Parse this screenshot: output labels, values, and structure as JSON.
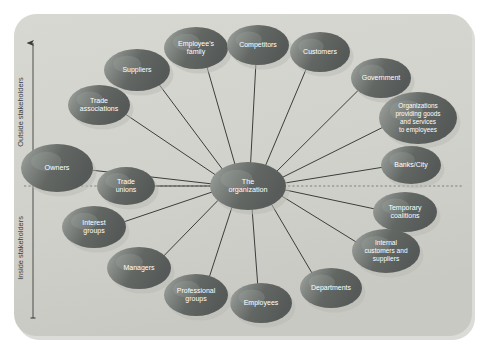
{
  "figure": {
    "panel": {
      "x": 14,
      "y": 14,
      "width": 458,
      "height": 322,
      "radius": 22,
      "fill": "#d3d3ce",
      "edge_shadow": "#bdbdb8"
    },
    "background_color": "#ffffff",
    "caption": ""
  },
  "axis": {
    "name": "stakeholder-axis",
    "x": 33,
    "top_y": 43,
    "bottom_y": 318,
    "color": "#3c3c3c",
    "arrow_end": "top",
    "labels": {
      "outside": "Outside stakeholders",
      "inside": "Inside stakeholders"
    },
    "outside_label_y": 112,
    "inside_label_y": 248
  },
  "divider": {
    "name": "inside-outside-divider",
    "y": 186,
    "x_start": 24,
    "x_end": 462,
    "style": "dashed",
    "color": "#5c5c5c"
  },
  "center": {
    "id": "the-organization",
    "label": "The organization",
    "lines": [
      "The",
      "organization"
    ],
    "cx": 248,
    "cy": 186,
    "rx": 38,
    "ry": 24,
    "font_size": 7.2
  },
  "node_style": {
    "fill_dark": "#5e6160",
    "fill_mid": "#7c807d",
    "fill_light": "#9aa09b",
    "highlight": "#aab0aa",
    "shadow": "#b9b9b4",
    "text_color": "#ffffff",
    "line_color": "#2b2b2b",
    "line_width": 0.9
  },
  "nodes": [
    {
      "id": "suppliers",
      "label": "Suppliers",
      "lines": [
        "Suppliers"
      ],
      "cx": 137,
      "cy": 70,
      "rx": 33,
      "ry": 21,
      "font_size": 7.0,
      "group": "outside"
    },
    {
      "id": "employees-family",
      "label": "Employee's family",
      "lines": [
        "Employee's",
        "family"
      ],
      "cx": 196,
      "cy": 48,
      "rx": 32,
      "ry": 21,
      "font_size": 7.0,
      "group": "outside"
    },
    {
      "id": "competitors",
      "label": "Competitors",
      "lines": [
        "Competitors"
      ],
      "cx": 258,
      "cy": 45,
      "rx": 31,
      "ry": 20,
      "font_size": 7.0,
      "group": "outside"
    },
    {
      "id": "customers",
      "label": "Customers",
      "lines": [
        "Customers"
      ],
      "cx": 320,
      "cy": 52,
      "rx": 30,
      "ry": 20,
      "font_size": 7.0,
      "group": "outside"
    },
    {
      "id": "government",
      "label": "Government",
      "lines": [
        "Government"
      ],
      "cx": 381,
      "cy": 78,
      "rx": 30,
      "ry": 20,
      "font_size": 7.0,
      "group": "outside"
    },
    {
      "id": "organizations-providing-goods",
      "label": "Organizations providing goods and services to employees",
      "lines": [
        "Organizations",
        "providing goods",
        "and services",
        "to employees"
      ],
      "cx": 418,
      "cy": 118,
      "rx": 39,
      "ry": 26,
      "font_size": 6.4,
      "group": "outside"
    },
    {
      "id": "banks-city",
      "label": "Banks/City",
      "lines": [
        "Banks/City"
      ],
      "cx": 411,
      "cy": 165,
      "rx": 30,
      "ry": 19,
      "font_size": 7.0,
      "group": "outside"
    },
    {
      "id": "trade-associations",
      "label": "Trade associations",
      "lines": [
        "Trade",
        "associations"
      ],
      "cx": 99,
      "cy": 105,
      "rx": 31,
      "ry": 20,
      "font_size": 7.0,
      "group": "outside"
    },
    {
      "id": "owners",
      "label": "Owners",
      "lines": [
        "Owners"
      ],
      "cx": 57,
      "cy": 168,
      "rx": 36,
      "ry": 24,
      "font_size": 7.2,
      "group": "outside"
    },
    {
      "id": "trade-unions",
      "label": "Trade unions",
      "lines": [
        "Trade",
        "unions"
      ],
      "cx": 126,
      "cy": 186,
      "rx": 29,
      "ry": 19,
      "font_size": 7.0,
      "group": "boundary"
    },
    {
      "id": "temporary-coalitions",
      "label": "Temporary coalitions",
      "lines": [
        "Temporary",
        "coalitions"
      ],
      "cx": 405,
      "cy": 212,
      "rx": 32,
      "ry": 20,
      "font_size": 7.0,
      "group": "inside"
    },
    {
      "id": "internal-customers-suppliers",
      "label": "Internal customers and suppliers",
      "lines": [
        "Internal",
        "customers and",
        "suppliers"
      ],
      "cx": 386,
      "cy": 251,
      "rx": 34,
      "ry": 22,
      "font_size": 6.6,
      "group": "inside"
    },
    {
      "id": "departments",
      "label": "Departments",
      "lines": [
        "Departments"
      ],
      "cx": 331,
      "cy": 288,
      "rx": 31,
      "ry": 20,
      "font_size": 7.0,
      "group": "inside"
    },
    {
      "id": "employees",
      "label": "Employees",
      "lines": [
        "Employees"
      ],
      "cx": 261,
      "cy": 303,
      "rx": 31,
      "ry": 20,
      "font_size": 7.0,
      "group": "inside"
    },
    {
      "id": "professional-groups",
      "label": "Professional groups",
      "lines": [
        "Professional",
        "groups"
      ],
      "cx": 196,
      "cy": 295,
      "rx": 32,
      "ry": 21,
      "font_size": 7.0,
      "group": "inside"
    },
    {
      "id": "managers",
      "label": "Managers",
      "lines": [
        "Managers"
      ],
      "cx": 139,
      "cy": 268,
      "rx": 32,
      "ry": 21,
      "font_size": 7.0,
      "group": "inside"
    },
    {
      "id": "interest-groups",
      "label": "Interest groups",
      "lines": [
        "Interest",
        "groups"
      ],
      "cx": 94,
      "cy": 227,
      "rx": 32,
      "ry": 21,
      "font_size": 7.0,
      "group": "inside"
    }
  ],
  "connections": [
    {
      "from": "the-organization",
      "to": "suppliers"
    },
    {
      "from": "the-organization",
      "to": "employees-family"
    },
    {
      "from": "the-organization",
      "to": "competitors"
    },
    {
      "from": "the-organization",
      "to": "customers"
    },
    {
      "from": "the-organization",
      "to": "government"
    },
    {
      "from": "the-organization",
      "to": "organizations-providing-goods"
    },
    {
      "from": "the-organization",
      "to": "banks-city"
    },
    {
      "from": "the-organization",
      "to": "trade-associations"
    },
    {
      "from": "the-organization",
      "to": "owners"
    },
    {
      "from": "the-organization",
      "to": "trade-unions"
    },
    {
      "from": "the-organization",
      "to": "temporary-coalitions"
    },
    {
      "from": "the-organization",
      "to": "internal-customers-suppliers"
    },
    {
      "from": "the-organization",
      "to": "departments"
    },
    {
      "from": "the-organization",
      "to": "employees"
    },
    {
      "from": "the-organization",
      "to": "professional-groups"
    },
    {
      "from": "the-organization",
      "to": "managers"
    },
    {
      "from": "the-organization",
      "to": "interest-groups"
    }
  ]
}
